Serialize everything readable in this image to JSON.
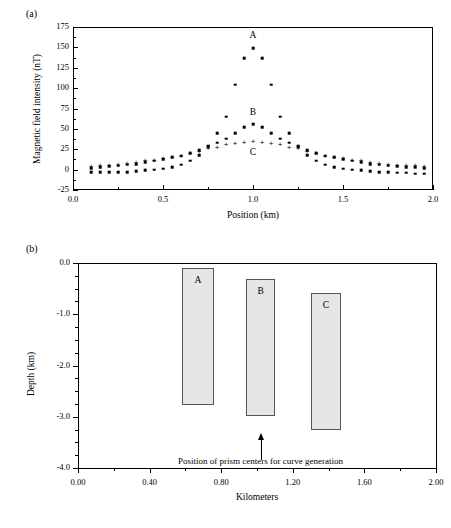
{
  "figure": {
    "panel_a_tag": "(a)",
    "panel_b_tag": "(b)"
  },
  "chart_data": [
    {
      "type": "scatter",
      "panel": "(a)",
      "title": "",
      "xlabel": "Position (km)",
      "ylabel": "Magnetic field intensity (nT)",
      "xlim": [
        0.0,
        2.0
      ],
      "ylim": [
        -25,
        175
      ],
      "xticks": [
        0.0,
        0.5,
        1.0,
        1.5,
        2.0
      ],
      "xticklabels": [
        "0.0",
        "0.5",
        "1.0",
        "1.5",
        "2.0"
      ],
      "yticks": [
        -25,
        0,
        25,
        50,
        75,
        100,
        125,
        150,
        175
      ],
      "yticklabels": [
        "-25",
        "0",
        "25",
        "50",
        "75",
        "100",
        "125",
        "150",
        "175"
      ],
      "grid": false,
      "legend": "inline-labels",
      "annotations": [
        {
          "text": "A",
          "x": 1.0,
          "y": 163
        },
        {
          "text": "B",
          "x": 1.0,
          "y": 68
        },
        {
          "text": "C",
          "x": 1.0,
          "y": 19
        }
      ],
      "series": [
        {
          "name": "A",
          "marker": "square",
          "x": [
            0.1,
            0.15,
            0.2,
            0.25,
            0.3,
            0.35,
            0.4,
            0.45,
            0.5,
            0.55,
            0.6,
            0.65,
            0.7,
            0.75,
            0.8,
            0.85,
            0.9,
            0.95,
            1.0,
            1.05,
            1.1,
            1.15,
            1.2,
            1.25,
            1.3,
            1.35,
            1.4,
            1.45,
            1.5,
            1.55,
            1.6,
            1.65,
            1.7,
            1.75,
            1.8,
            1.85,
            1.9,
            1.95
          ],
          "values": [
            -3,
            -3,
            -3,
            -3,
            -3,
            -2,
            -1,
            0,
            1,
            3,
            6,
            11,
            18,
            29,
            45,
            65,
            104,
            137,
            149,
            137,
            104,
            65,
            45,
            29,
            18,
            11,
            6,
            3,
            1,
            0,
            -1,
            -2,
            -3,
            -3,
            -4,
            -4,
            -5,
            -5
          ]
        },
        {
          "name": "B",
          "marker": "square",
          "x": [
            0.1,
            0.15,
            0.2,
            0.25,
            0.3,
            0.35,
            0.4,
            0.45,
            0.5,
            0.55,
            0.6,
            0.65,
            0.7,
            0.75,
            0.8,
            0.85,
            0.9,
            0.95,
            1.0,
            1.05,
            1.1,
            1.15,
            1.2,
            1.25,
            1.3,
            1.35,
            1.4,
            1.45,
            1.5,
            1.55,
            1.6,
            1.65,
            1.7,
            1.75,
            1.8,
            1.85,
            1.9,
            1.95
          ],
          "values": [
            2,
            3,
            4,
            5,
            6,
            7,
            9,
            11,
            13,
            15,
            17,
            20,
            24,
            28,
            33,
            38,
            45,
            52,
            56,
            52,
            45,
            38,
            33,
            28,
            24,
            20,
            17,
            15,
            13,
            11,
            9,
            7,
            6,
            5,
            4,
            3,
            3,
            2
          ]
        },
        {
          "name": "C",
          "marker": "plus",
          "x": [
            0.1,
            0.15,
            0.2,
            0.25,
            0.3,
            0.35,
            0.4,
            0.45,
            0.5,
            0.55,
            0.6,
            0.65,
            0.7,
            0.75,
            0.8,
            0.85,
            0.9,
            0.95,
            1.0,
            1.05,
            1.1,
            1.15,
            1.2,
            1.25,
            1.3,
            1.35,
            1.4,
            1.45,
            1.5,
            1.55,
            1.6,
            1.65,
            1.7,
            1.75,
            1.8,
            1.85,
            1.9,
            1.95
          ],
          "values": [
            3,
            4,
            5,
            6,
            7,
            8,
            10,
            11,
            13,
            14,
            16,
            19,
            22,
            25,
            27,
            30,
            32,
            33,
            34,
            33,
            32,
            30,
            27,
            25,
            22,
            19,
            16,
            14,
            13,
            11,
            10,
            8,
            7,
            6,
            5,
            4,
            4,
            3
          ]
        }
      ]
    },
    {
      "type": "bar",
      "panel": "(b)",
      "title": "",
      "xlabel": "Kilometers",
      "ylabel": "Depth (km)",
      "xlim": [
        0.0,
        2.0
      ],
      "ylim": [
        -4.0,
        0.0
      ],
      "xticks": [
        0.0,
        0.4,
        0.8,
        1.2,
        1.6,
        2.0
      ],
      "xticklabels": [
        "0.00",
        "0.40",
        "0.80",
        "1.20",
        "1.60",
        "2.00"
      ],
      "yticks": [
        0.0,
        -1.0,
        -2.0,
        -3.0,
        -4.0
      ],
      "yticklabels": [
        "0.0",
        "-1.0",
        "-2.0",
        "-3.0",
        "-4.0"
      ],
      "grid": false,
      "prisms": [
        {
          "name": "A",
          "x_left": 0.58,
          "x_right": 0.76,
          "top": -0.1,
          "bottom": -2.78
        },
        {
          "name": "B",
          "x_left": 0.94,
          "x_right": 1.1,
          "top": -0.32,
          "bottom": -2.98
        },
        {
          "name": "C",
          "x_left": 1.3,
          "x_right": 1.47,
          "top": -0.58,
          "bottom": -3.25
        }
      ],
      "annotation": {
        "text": "Position of prism centers for curve generation",
        "arrow_x": 1.02,
        "arrow_tip_y": -3.45,
        "arrow_base_y": -3.85
      }
    }
  ]
}
